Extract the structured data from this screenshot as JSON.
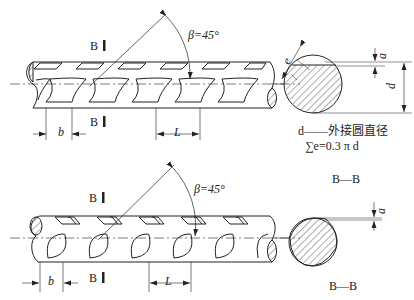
{
  "diagram": {
    "colors": {
      "line": "#222222",
      "hatch": "#333333",
      "background": "#ffffff"
    },
    "top_view": {
      "section_marks": [
        "B",
        "B"
      ],
      "angle_label": "β=45°",
      "dim_b": "b",
      "dim_L": "L",
      "cross_section": {
        "dim_e": "e",
        "dim_a": "a",
        "dim_d": "d",
        "note_line1": "d——外接圆直径",
        "note_line2": "∑e=0.3 π d"
      }
    },
    "bottom_view": {
      "section_marks": [
        "B",
        "B"
      ],
      "angle_label": "β=45°",
      "dim_b": "b",
      "dim_L": "L",
      "cross_section": {
        "title_top": "B—B",
        "title_bottom": "B—B",
        "dim_a": "a"
      }
    }
  }
}
